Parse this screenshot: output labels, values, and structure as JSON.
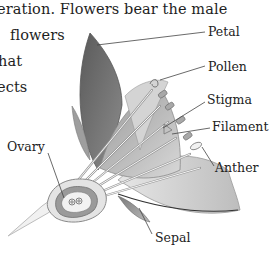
{
  "body_text": {
    "lines": [
      "eration. Flowers bear the male",
      "flowers",
      "hat",
      "ects"
    ]
  },
  "diagram": {
    "labels": {
      "petal": "Petal",
      "pollen": "Pollen",
      "stigma": "Stigma",
      "filament": "Filament",
      "anther": "Anther",
      "ovary": "Ovary",
      "sepal": "Sepal"
    },
    "colors": {
      "petal_dark": "#6e6e6e",
      "petal_light": "#c9c9c9",
      "leader_line": "#444444",
      "outline": "#8a8a8a"
    }
  }
}
